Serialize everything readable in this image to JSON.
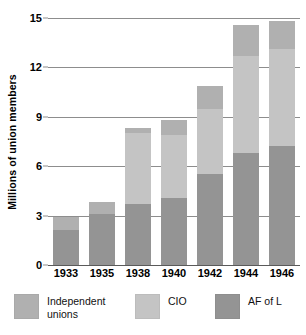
{
  "chart_data": {
    "type": "bar",
    "subtype": "stacked-vertical",
    "title": "",
    "xlabel": "",
    "ylabel": "Millions of union members",
    "categories": [
      "1933",
      "1935",
      "1938",
      "1940",
      "1942",
      "1944",
      "1946"
    ],
    "ylim": [
      0,
      15
    ],
    "yticks": [
      0,
      3,
      6,
      9,
      12,
      15
    ],
    "ytick_labels": [
      "0",
      "3",
      "6",
      "9",
      "12",
      "15"
    ],
    "grid": true,
    "grid_axis": "y",
    "legend_position": "bottom",
    "stack_order_bottom_to_top": [
      "AF of L",
      "CIO",
      "Independent unions"
    ],
    "series": [
      {
        "name": "AF of L",
        "color": "#949494",
        "values": [
          2.1,
          3.1,
          3.7,
          4.1,
          5.5,
          6.8,
          7.2
        ]
      },
      {
        "name": "CIO",
        "color": "#c4c4c4",
        "values": [
          0.0,
          0.0,
          4.3,
          3.8,
          4.0,
          5.9,
          5.9
        ]
      },
      {
        "name": "Independent unions",
        "color": "#b0b0b0",
        "values": [
          0.8,
          0.7,
          0.3,
          0.9,
          1.4,
          1.9,
          1.7
        ]
      }
    ],
    "totals": [
      2.9,
      3.8,
      8.3,
      8.8,
      10.9,
      14.6,
      14.8
    ]
  },
  "axes": {
    "y_title": "Millions of union members",
    "y_tick_labels": [
      "0",
      "3",
      "6",
      "9",
      "12",
      "15"
    ],
    "x_tick_labels": [
      "1933",
      "1935",
      "1938",
      "1940",
      "1942",
      "1944",
      "1946"
    ]
  },
  "legend": {
    "items": [
      {
        "label": "Independent\nunions",
        "color": "#b0b0b0"
      },
      {
        "label": "CIO",
        "color": "#c4c4c4"
      },
      {
        "label": "AF of L",
        "color": "#949494"
      }
    ]
  },
  "colors": {
    "af_of_l": "#949494",
    "cio": "#c4c4c4",
    "independent": "#b0b0b0",
    "gridline": "#8d8d8d",
    "background": "#ffffff",
    "text": "#000000"
  }
}
